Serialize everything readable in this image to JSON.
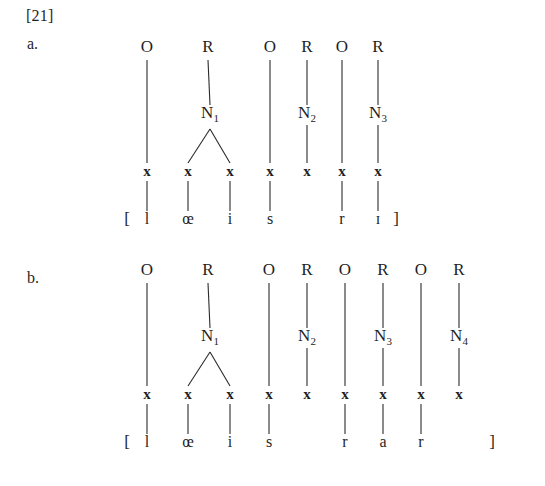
{
  "example": {
    "number": "[21]",
    "items": [
      {
        "letter": "a."
      },
      {
        "letter": "b."
      }
    ]
  },
  "colors": {
    "text": "#1f1f1f",
    "line": "#2b2b2b",
    "background": "#ffffff"
  },
  "diagrams": [
    {
      "id": "a",
      "label": "a.",
      "open_bracket": "[",
      "close_bracket": "]",
      "constituents": [
        "O",
        "R",
        "O",
        "R",
        "O",
        "R"
      ],
      "nuclei": [
        {
          "label": "N",
          "subscript": "1",
          "branching": true
        },
        {
          "label": "N",
          "subscript": "2",
          "branching": false
        },
        {
          "label": "N",
          "subscript": "3",
          "branching": false
        }
      ],
      "skeleton": [
        "x",
        "x",
        "x",
        "x",
        "x",
        "x",
        "x"
      ],
      "segments": [
        "l",
        "œ",
        "i",
        "s",
        "",
        "r",
        "ɪ"
      ],
      "transcription": "[l œ i s r ɪ]",
      "columns": [
        {
          "x": 147,
          "node": "O",
          "node_x": 147,
          "nucleus": null,
          "segment": "l",
          "linked": true
        },
        {
          "x": 188,
          "node": "R",
          "node_x": 208,
          "nucleus": "N1-left",
          "segment": "œ",
          "linked": true
        },
        {
          "x": 230,
          "node": null,
          "node_x": null,
          "nucleus": "N1-right",
          "segment": "i",
          "linked": true
        },
        {
          "x": 270,
          "node": "O",
          "node_x": 270,
          "nucleus": null,
          "segment": "s",
          "linked": true
        },
        {
          "x": 307,
          "node": "R",
          "node_x": 307,
          "nucleus": "N2",
          "segment": "",
          "linked": false
        },
        {
          "x": 342,
          "node": "O",
          "node_x": 342,
          "nucleus": null,
          "segment": "r",
          "linked": true
        },
        {
          "x": 378,
          "node": "R",
          "node_x": 378,
          "nucleus": "N3",
          "segment": "ɪ",
          "linked": true
        }
      ],
      "bracket_left_x": 127,
      "bracket_right_x": 396
    },
    {
      "id": "b",
      "label": "b.",
      "open_bracket": "[",
      "close_bracket": "]",
      "constituents": [
        "O",
        "R",
        "O",
        "R",
        "O",
        "R",
        "O",
        "R"
      ],
      "nuclei": [
        {
          "label": "N",
          "subscript": "1",
          "branching": true
        },
        {
          "label": "N",
          "subscript": "2",
          "branching": false
        },
        {
          "label": "N",
          "subscript": "3",
          "branching": false
        },
        {
          "label": "N",
          "subscript": "4",
          "branching": false
        }
      ],
      "skeleton": [
        "x",
        "x",
        "x",
        "x",
        "x",
        "x",
        "x",
        "x",
        "x"
      ],
      "segments": [
        "l",
        "œ",
        "i",
        "s",
        "",
        "r",
        "a",
        "r",
        ""
      ],
      "transcription": "[l œ i s r a r ]",
      "columns": [
        {
          "x": 147,
          "node": "O",
          "node_x": 147,
          "nucleus": null,
          "segment": "l",
          "linked": true
        },
        {
          "x": 188,
          "node": "R",
          "node_x": 208,
          "nucleus": "N1-left",
          "segment": "œ",
          "linked": true
        },
        {
          "x": 230,
          "node": null,
          "node_x": null,
          "nucleus": "N1-right",
          "segment": "i",
          "linked": true
        },
        {
          "x": 269,
          "node": "O",
          "node_x": 269,
          "nucleus": null,
          "segment": "s",
          "linked": true
        },
        {
          "x": 307,
          "node": "R",
          "node_x": 307,
          "nucleus": "N2",
          "segment": "",
          "linked": false
        },
        {
          "x": 345,
          "node": "O",
          "node_x": 345,
          "nucleus": null,
          "segment": "r",
          "linked": true
        },
        {
          "x": 383,
          "node": "R",
          "node_x": 383,
          "nucleus": "N3",
          "segment": "a",
          "linked": true
        },
        {
          "x": 421,
          "node": "O",
          "node_x": 421,
          "nucleus": null,
          "segment": "r",
          "linked": true
        },
        {
          "x": 459,
          "node": "R",
          "node_x": 459,
          "nucleus": "N4",
          "segment": "",
          "linked": false
        }
      ],
      "bracket_left_x": 127,
      "bracket_right_x": 492
    }
  ],
  "geometry": {
    "row_node_a": 52,
    "row_nuc_a": 118,
    "row_x_a": 176,
    "row_seg_a": 224,
    "row_node_b": 275,
    "row_nuc_b": 341,
    "row_x_b": 399,
    "row_seg_b": 447
  }
}
